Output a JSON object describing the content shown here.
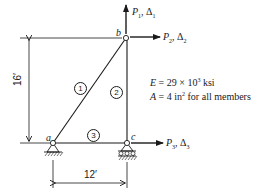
{
  "diagram": {
    "type": "plane truss",
    "nodes": [
      {
        "id": "a",
        "label": "a",
        "support": "pin"
      },
      {
        "id": "b",
        "label": "b",
        "support": "none"
      },
      {
        "id": "c",
        "label": "c",
        "support": "roller"
      }
    ],
    "members": [
      {
        "id": "1",
        "label": "1",
        "from": "a",
        "to": "b"
      },
      {
        "id": "2",
        "label": "2",
        "from": "c",
        "to": "b"
      },
      {
        "id": "3",
        "label": "3",
        "from": "a",
        "to": "c"
      }
    ],
    "loads": [
      {
        "node": "b",
        "direction": "up",
        "force": "P",
        "force_sub": "1",
        "disp": "Δ",
        "disp_sub": "1"
      },
      {
        "node": "b",
        "direction": "right",
        "force": "P",
        "force_sub": "2",
        "disp": "Δ",
        "disp_sub": "2"
      },
      {
        "node": "c",
        "direction": "right",
        "force": "P",
        "force_sub": "3",
        "disp": "Δ",
        "disp_sub": "3"
      }
    ],
    "dimensions": {
      "height": "16′",
      "width": "12′"
    },
    "properties": {
      "E_label": "E",
      "E_value": "= 29 × 10",
      "E_exp": "3",
      "E_unit": " ksi",
      "A_label": "A",
      "A_value": "= 4 in",
      "A_exp": "2",
      "A_unit": " for all members"
    }
  }
}
